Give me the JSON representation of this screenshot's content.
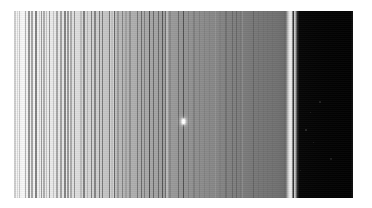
{
  "figure": {
    "name": "saturn-ring-radial-scan",
    "type": "grayscale-astronomical-image",
    "orientation": "radial distance increases left to right",
    "page_background": "#ffffff",
    "plate": {
      "left": 14,
      "top": 11,
      "width": 339,
      "height": 187,
      "background": "#000000"
    }
  },
  "regions": [
    {
      "id": "inner-bright-ringlets",
      "label": "Inner bright ringlet belt",
      "x_start": 0,
      "x_end": 100,
      "mean_gray": "#ededed",
      "character": "very bright, densely striated with narrow ringlets"
    },
    {
      "id": "mid-transition",
      "label": "Mid transition band",
      "x_start": 100,
      "x_end": 175,
      "mean_gray": "#b9b9b9",
      "character": "moderate brightness with strong narrow dark ringlets"
    },
    {
      "id": "outer-grey-plateau",
      "label": "Outer grey plateau",
      "x_start": 175,
      "x_end": 272,
      "mean_gray": "#808080",
      "character": "smooth mid-grey, gently darkening outward"
    },
    {
      "id": "outer-edge-bright-rim",
      "label": "Sharp bright outer ring edge",
      "x_start": 272,
      "x_end": 280,
      "mean_gray": "#d8d8d8",
      "character": "narrow high-contrast bright rim at ring boundary"
    },
    {
      "id": "empty-space",
      "label": "Empty space beyond ring edge",
      "x_start": 280,
      "x_end": 339,
      "mean_gray": "#040404",
      "character": "black background with a few faint specks"
    }
  ],
  "base_ramp": "linear-gradient(to right, #f7f7f7 0%, #f2f2f2 4%, #ececec 9%, #e6e6e6 14%, #dcdcdc 19%, #d2d2d2 23%, #c6c6c6 27%, #bdbdbd 30%, #b4b4b4 33%, #adadad 36%, #a8a8a8 39%, #a3a3a3 42%, #9d9d9d 45%, #989898 48%, #949494 51%, #8f8f8f 54%, #8a8a8a 57%, #868686 60%, #828282 63%, #7e7e7e 66%, #7a7a7a 69%, #777777 72%, #747474 75%, #727272 77%, #6f6f6f 79%, #6d6d6d 80.2%, #dcdcdc 81.6%, #e6e6e6 82.4%, #b4b4b4 83.0%, #2a2a2a 83.6%, #060606 84.2%, #030303 92%, #020202 99.2%, #111111 100%)",
  "ringlet_striations": "repeating-linear-gradient(to right, rgba(0,0,0,0) 0px, rgba(0,0,0,0.10) 0.6px, rgba(0,0,0,0) 1.3px, rgba(0,0,0,0.05) 2.1px, rgba(0,0,0,0) 3.0px)",
  "moonlet": {
    "label": "bright embedded moonlet / field star",
    "x": 168,
    "y": 108,
    "width": 3,
    "height": 5,
    "color": "#ffffff"
  },
  "specks": [
    {
      "label": "faint-speck-1",
      "x": 305,
      "y": 90,
      "size": 2,
      "color": "#2a2a2a"
    },
    {
      "label": "faint-speck-2",
      "x": 296,
      "y": 101,
      "size": 1,
      "color": "#232323"
    },
    {
      "label": "faint-speck-3",
      "x": 291,
      "y": 118,
      "size": 2,
      "color": "#303030"
    },
    {
      "label": "faint-speck-4",
      "x": 299,
      "y": 131,
      "size": 1,
      "color": "#222222"
    },
    {
      "label": "faint-speck-5",
      "x": 316,
      "y": 147,
      "size": 2,
      "color": "#262626"
    },
    {
      "label": "faint-speck-6",
      "x": 286,
      "y": 159,
      "size": 1,
      "color": "#1e1e1e"
    }
  ],
  "chart_data": {
    "type": "line",
    "xlabel": "radial position (px across plate)",
    "ylabel": "brightness (0-255)",
    "xlim": [
      0,
      339
    ],
    "ylim": [
      0,
      255
    ],
    "grid": false,
    "legend": "none",
    "x": [
      0,
      10,
      20,
      30,
      40,
      50,
      60,
      70,
      80,
      90,
      100,
      110,
      120,
      130,
      140,
      150,
      160,
      170,
      180,
      190,
      200,
      210,
      220,
      230,
      240,
      250,
      260,
      265,
      270,
      274,
      277,
      280,
      284,
      290,
      300,
      310,
      320,
      330,
      339
    ],
    "series": [
      {
        "name": "mean column brightness",
        "values": [
          247,
          242,
          236,
          230,
          224,
          216,
          207,
          198,
          190,
          183,
          177,
          172,
          167,
          163,
          159,
          155,
          151,
          148,
          145,
          142,
          139,
          136,
          133,
          130,
          126,
          122,
          118,
          116,
          114,
          120,
          210,
          230,
          60,
          8,
          4,
          3,
          3,
          3,
          17
        ]
      }
    ],
    "annotations": [
      {
        "x": 277,
        "y": 230,
        "text": "sharp bright outer ring edge"
      },
      {
        "x": 290,
        "y": 8,
        "text": "empty space"
      },
      {
        "x": 168,
        "y": 250,
        "text": "bright moonlet"
      }
    ]
  }
}
